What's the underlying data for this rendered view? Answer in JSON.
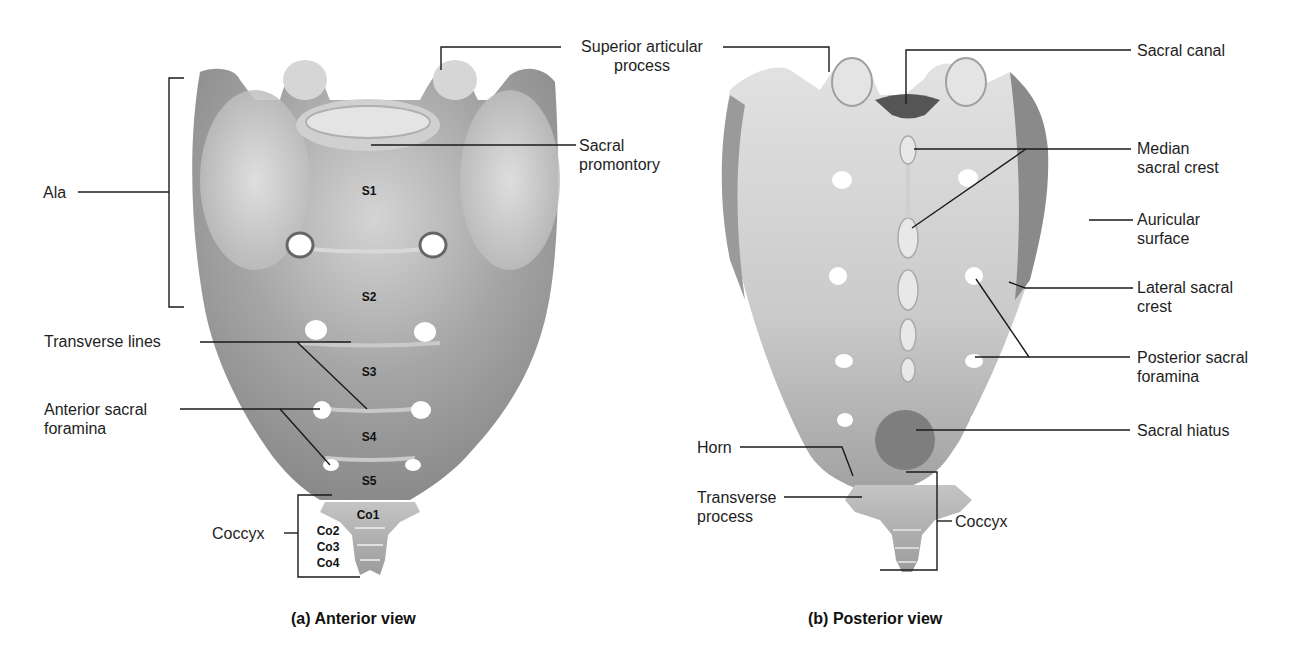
{
  "figure": {
    "panels": [
      {
        "id": "a",
        "caption": "(a) Anterior view",
        "segments": [
          "S1",
          "S2",
          "S3",
          "S4",
          "S5",
          "Co1",
          "Co2",
          "Co3",
          "Co4"
        ],
        "labels": {
          "ala": "Ala",
          "superior_articular_process_1": "Superior articular",
          "superior_articular_process_2": "process",
          "sacral_promontory_1": "Sacral",
          "sacral_promontory_2": "promontory",
          "transverse_lines": "Transverse lines",
          "anterior_sacral_foramina_1": "Anterior sacral",
          "anterior_sacral_foramina_2": "foramina",
          "coccyx": "Coccyx"
        }
      },
      {
        "id": "b",
        "caption": "(b) Posterior view",
        "labels": {
          "sacral_canal": "Sacral canal",
          "median_sacral_crest_1": "Median",
          "median_sacral_crest_2": "sacral crest",
          "auricular_surface_1": "Auricular",
          "auricular_surface_2": "surface",
          "lateral_sacral_crest_1": "Lateral sacral",
          "lateral_sacral_crest_2": "crest",
          "posterior_sacral_foramina_1": "Posterior sacral",
          "posterior_sacral_foramina_2": "foramina",
          "sacral_hiatus": "Sacral hiatus",
          "horn": "Horn",
          "transverse_process_1": "Transverse",
          "transverse_process_2": "process",
          "coccyx": "Coccyx"
        }
      }
    ],
    "colors": {
      "bone_light": "#e6e6e6",
      "bone_mid": "#b9b9b9",
      "bone_dark": "#7d7d7d",
      "line": "#1a1a1a",
      "background": "#ffffff"
    }
  }
}
